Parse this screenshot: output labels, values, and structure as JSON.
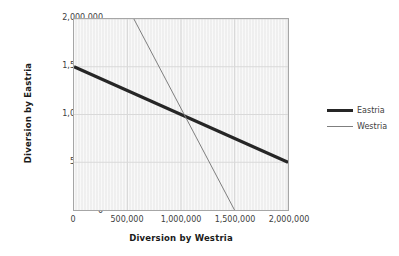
{
  "chart_data": {
    "type": "line",
    "title": "",
    "xlabel": "Diversion by Westria",
    "ylabel": "Diversion by Eastria",
    "xlim": [
      0,
      2000000
    ],
    "ylim": [
      0,
      2000000
    ],
    "grid": true,
    "legend_position": "right",
    "xticks": [
      0,
      500000,
      1000000,
      1500000,
      2000000
    ],
    "yticks": [
      0,
      500000,
      1000000,
      1500000,
      2000000
    ],
    "xticklabels": [
      "0",
      "500,000",
      "1,000,000",
      "1,500,000",
      "2,000,000"
    ],
    "yticklabels": [
      "0",
      "500,000",
      "1,000,000",
      "1,500,000",
      "2,000,000"
    ],
    "series": [
      {
        "name": "Eastria",
        "color": "#262626",
        "width": 3.2,
        "x": [
          0,
          2000000
        ],
        "values": [
          1500000,
          500000
        ]
      },
      {
        "name": "Westria",
        "color": "#7f7f7f",
        "width": 1.0,
        "x": [
          560000,
          1500000
        ],
        "values": [
          2000000,
          0
        ]
      }
    ],
    "annotations": [
      {
        "label": "intersection",
        "x": 1000000,
        "y": 1000000
      }
    ]
  },
  "axes": {
    "x_title": "Diversion by Westria",
    "y_title": "Diversion by Eastria",
    "x_ticks": [
      "0",
      "500,000",
      "1,000,000",
      "1,500,000",
      "2,000,000"
    ],
    "y_ticks": [
      "0",
      "500,000",
      "1,000,000",
      "1,500,000",
      "2,000,000"
    ]
  },
  "legend": {
    "items": [
      {
        "label": "Eastria"
      },
      {
        "label": "Westria"
      }
    ]
  },
  "colors": {
    "eastria": "#262626",
    "westria": "#7f7f7f",
    "plot_background": "#f2f2f2",
    "plot_border": "#a6a6a6",
    "gridline": "#d9d9d9",
    "text": "#404040"
  }
}
